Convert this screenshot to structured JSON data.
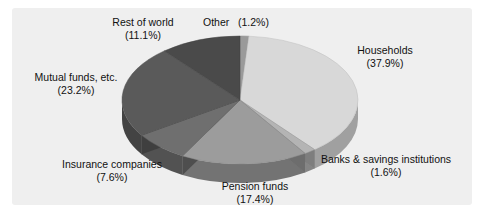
{
  "panel": {
    "background": "#efefef"
  },
  "chart_data": {
    "type": "pie",
    "title": "",
    "subtitle": "",
    "xlabel": "",
    "ylabel": "",
    "legend_position": "none",
    "grid": false,
    "style": "3d-pie",
    "units": "percent",
    "total": 100.0,
    "start_angle_deg": 0,
    "direction": "clockwise",
    "categories": [
      "Other",
      "Households",
      "Banks & savings institutions",
      "Pension funds",
      "Insurance companies",
      "Mutual funds, etc.",
      "Rest of world"
    ],
    "values": [
      1.2,
      37.9,
      1.6,
      17.4,
      7.6,
      23.2,
      11.1
    ],
    "colors": [
      "#9a9a9a",
      "#d8d8d8",
      "#b4b4b4",
      "#9c9c9c",
      "#6f6f6f",
      "#5a5a5a",
      "#4a4a4a"
    ],
    "slices": [
      {
        "label": "Other",
        "value": 1.2,
        "pct_text": "(1.2%)",
        "color": "#9a9a9a"
      },
      {
        "label": "Households",
        "value": 37.9,
        "pct_text": "(37.9%)",
        "color": "#d8d8d8"
      },
      {
        "label": "Banks & savings institutions",
        "value": 1.6,
        "pct_text": "(1.6%)",
        "color": "#b4b4b4"
      },
      {
        "label": "Pension funds",
        "value": 17.4,
        "pct_text": "(17.4%)",
        "color": "#9c9c9c"
      },
      {
        "label": "Insurance companies",
        "value": 7.6,
        "pct_text": "(7.6%)",
        "color": "#6f6f6f"
      },
      {
        "label": "Mutual funds, etc.",
        "value": 23.2,
        "pct_text": "(23.2%)",
        "color": "#5a5a5a"
      },
      {
        "label": "Rest of world",
        "value": 11.1,
        "pct_text": "(11.1%)",
        "color": "#4a4a4a"
      }
    ]
  },
  "labels": {
    "rest_of_world": {
      "name": "Rest of world",
      "pct": "(11.1%)"
    },
    "other": {
      "name": "Other",
      "pct": "(1.2%)"
    },
    "households": {
      "name": "Households",
      "pct": "(37.9%)"
    },
    "banks": {
      "name": "Banks & savings institutions",
      "pct": "(1.6%)"
    },
    "pension": {
      "name": "Pension funds",
      "pct": "(17.4%)"
    },
    "insurance": {
      "name": "Insurance companies",
      "pct": "(7.6%)"
    },
    "mutual": {
      "name": "Mutual funds, etc.",
      "pct": "(23.2%)"
    }
  }
}
